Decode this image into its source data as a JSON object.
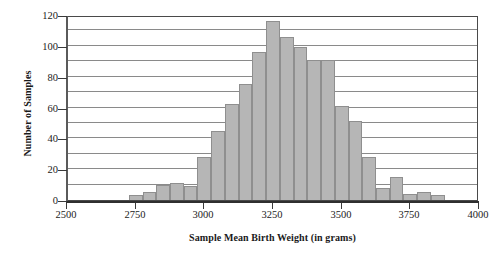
{
  "chart_data": {
    "type": "bar",
    "title": "",
    "subtitle": "",
    "xlabel": "Sample Mean Birth Weight (in grams)",
    "ylabel": "Number of Samples",
    "xlim": [
      2500,
      4000
    ],
    "ylim": [
      0,
      120
    ],
    "bin_width": 50,
    "grid": true,
    "grid_step": 10,
    "legend": "none",
    "bar_color": "#b6b6b6",
    "bar_edge_color": "#8f8f8f",
    "x_ticks": [
      2500,
      2750,
      3000,
      3250,
      3500,
      3750,
      4000
    ],
    "x_tick_labels": [
      "2500",
      "2750",
      "3000",
      "3250",
      "3500",
      "3750",
      "4000"
    ],
    "y_ticks": [
      0,
      20,
      40,
      60,
      80,
      100,
      120
    ],
    "y_tick_labels": [
      "0",
      "20",
      "40",
      "60",
      "80",
      "100",
      "120"
    ],
    "bins": [
      {
        "start": 2725,
        "end": 2775,
        "value": 3
      },
      {
        "start": 2775,
        "end": 2825,
        "value": 5
      },
      {
        "start": 2825,
        "end": 2875,
        "value": 10
      },
      {
        "start": 2875,
        "end": 2925,
        "value": 11
      },
      {
        "start": 2925,
        "end": 2975,
        "value": 9
      },
      {
        "start": 2975,
        "end": 3025,
        "value": 28
      },
      {
        "start": 3025,
        "end": 3075,
        "value": 45
      },
      {
        "start": 3075,
        "end": 3125,
        "value": 62
      },
      {
        "start": 3125,
        "end": 3175,
        "value": 75
      },
      {
        "start": 3175,
        "end": 3225,
        "value": 96
      },
      {
        "start": 3225,
        "end": 3275,
        "value": 116
      },
      {
        "start": 3275,
        "end": 3325,
        "value": 106
      },
      {
        "start": 3325,
        "end": 3375,
        "value": 99
      },
      {
        "start": 3375,
        "end": 3425,
        "value": 91
      },
      {
        "start": 3425,
        "end": 3475,
        "value": 91
      },
      {
        "start": 3475,
        "end": 3525,
        "value": 61
      },
      {
        "start": 3525,
        "end": 3575,
        "value": 51
      },
      {
        "start": 3575,
        "end": 3625,
        "value": 28
      },
      {
        "start": 3625,
        "end": 3675,
        "value": 8
      },
      {
        "start": 3675,
        "end": 3725,
        "value": 15
      },
      {
        "start": 3725,
        "end": 3775,
        "value": 4
      },
      {
        "start": 3775,
        "end": 3825,
        "value": 5
      },
      {
        "start": 3825,
        "end": 3875,
        "value": 3
      }
    ]
  }
}
